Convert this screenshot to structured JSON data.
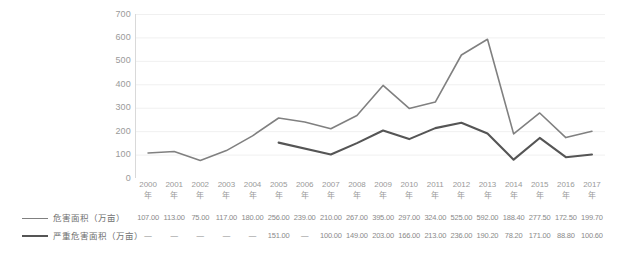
{
  "chart_data": {
    "type": "line",
    "title": "",
    "subtitle": "",
    "xlabel": "",
    "ylabel": "",
    "categories": [
      "2000年",
      "2001年",
      "2002年",
      "2003年",
      "2004年",
      "2005年",
      "2006年",
      "2007年",
      "2008年",
      "2009年",
      "2010年",
      "2011年",
      "2012年",
      "2013年",
      "2014年",
      "2015年",
      "2016年",
      "2017年"
    ],
    "category_numbers": [
      "2000",
      "2001",
      "2002",
      "2003",
      "2004",
      "2005",
      "2006",
      "2007",
      "2008",
      "2009",
      "2010",
      "2011",
      "2012",
      "2013",
      "2014",
      "2015",
      "2016",
      "2017"
    ],
    "category_suffix": "年",
    "series": [
      {
        "name": "危害面积（万亩）",
        "color": "#808080",
        "values": [
          107.0,
          113.0,
          75.0,
          117.0,
          180.0,
          256.0,
          239.0,
          210.0,
          267.0,
          395.0,
          297.0,
          324.0,
          525.0,
          592.0,
          188.4,
          277.5,
          172.5,
          199.7
        ],
        "value_labels": [
          "107.00",
          "113.00",
          "75.00",
          "117.00",
          "180.00",
          "256.00",
          "239.00",
          "210.00",
          "267.00",
          "395.00",
          "297.00",
          "324.00",
          "525.00",
          "592.00",
          "188.40",
          "277.50",
          "172.50",
          "199.70"
        ]
      },
      {
        "name": "严重危害面积（万亩）",
        "color": "#555555",
        "values": [
          null,
          null,
          null,
          null,
          null,
          151.0,
          null,
          100.0,
          149.0,
          203.0,
          166.0,
          213.0,
          236.0,
          190.2,
          78.2,
          171.0,
          88.8,
          100.6
        ],
        "value_labels": [
          "—",
          "—",
          "—",
          "—",
          "—",
          "151.00",
          "—",
          "100.00",
          "149.00",
          "203.00",
          "166.00",
          "213.00",
          "236.00",
          "190.20",
          "78.20",
          "171.00",
          "88.80",
          "100.60"
        ]
      }
    ],
    "y_ticks": [
      "0",
      "100",
      "200",
      "300",
      "400",
      "500",
      "600",
      "700"
    ],
    "ylim": [
      0,
      700
    ],
    "grid": "horizontal",
    "legend_position": "bottom-left",
    "table_below": true
  }
}
